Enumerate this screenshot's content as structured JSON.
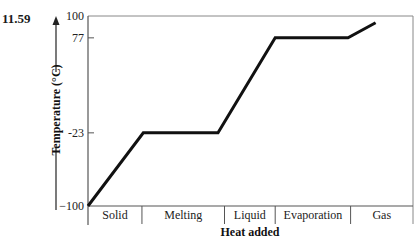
{
  "problem": {
    "number": "11.59"
  },
  "chart_data": {
    "type": "line",
    "title": "",
    "xlabel": "Heat added",
    "ylabel": "Temperature (°C)",
    "ylim": [
      -100,
      100
    ],
    "y_ticks": [
      {
        "value": 100,
        "label": "100"
      },
      {
        "value": 77,
        "label": "77"
      },
      {
        "value": -23,
        "label": "-23"
      },
      {
        "value": -100,
        "label": "−100"
      }
    ],
    "x_regions": [
      {
        "label": "Solid",
        "start": 0,
        "end": 0.166
      },
      {
        "label": "Melting",
        "start": 0.166,
        "end": 0.42
      },
      {
        "label": "Liquid",
        "start": 0.42,
        "end": 0.576
      },
      {
        "label": "Evaporation",
        "start": 0.576,
        "end": 0.808
      },
      {
        "label": "Gas",
        "start": 0.808,
        "end": 1.0
      }
    ],
    "series": [
      {
        "name": "Heating curve",
        "points": [
          {
            "x": 0.0,
            "y": -100
          },
          {
            "x": 0.17,
            "y": -23
          },
          {
            "x": 0.4,
            "y": -23
          },
          {
            "x": 0.576,
            "y": 77
          },
          {
            "x": 0.8,
            "y": 77
          },
          {
            "x": 0.885,
            "y": 93
          }
        ]
      }
    ],
    "grid": false,
    "legend": null,
    "frame": "box"
  },
  "colors": {
    "line": "#111111",
    "axis": "#555555",
    "text": "#222222"
  }
}
